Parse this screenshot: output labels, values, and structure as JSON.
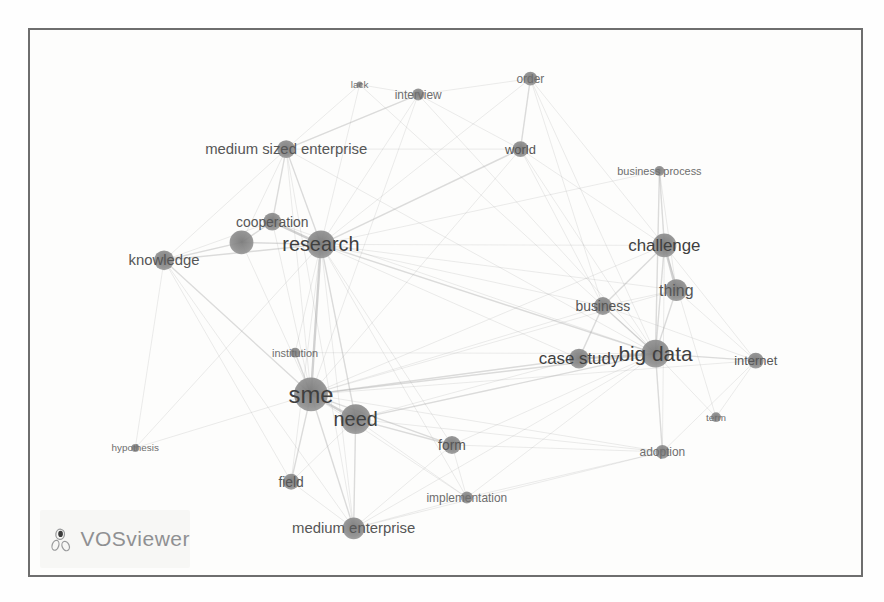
{
  "frame": {
    "border_color": "#6e6e6e",
    "background": "#fdfdfc"
  },
  "logo": {
    "text": "VOSviewer",
    "color": "#8f9092",
    "icon": "vosviewer-network-glyph"
  },
  "chart_data": {
    "type": "network",
    "title": "",
    "tool": "VOSviewer term co-occurrence map",
    "node_color": "#8a8a8a",
    "node_core_color": "#787878",
    "label_color_large": "#3f3f3f",
    "label_color_medium": "#565656",
    "label_color_small": "#6e6e6e",
    "edge_color": "#a8a8a8",
    "canvas": {
      "width": 835,
      "height": 549
    },
    "nodes": [
      {
        "id": "lack",
        "label": "lack",
        "x": 331,
        "y": 55,
        "r": 3,
        "fs": 10
      },
      {
        "id": "interview",
        "label": "interview",
        "x": 390,
        "y": 65,
        "r": 6,
        "fs": 12
      },
      {
        "id": "order",
        "label": "order",
        "x": 503,
        "y": 49,
        "r": 7,
        "fs": 12
      },
      {
        "id": "world",
        "label": "world",
        "x": 493,
        "y": 120,
        "r": 8,
        "fs": 13
      },
      {
        "id": "business-process",
        "label": "business process",
        "x": 633,
        "y": 142,
        "r": 5,
        "fs": 11
      },
      {
        "id": "medium-sized-enterprise",
        "label": "medium sized enterprise",
        "x": 257,
        "y": 120,
        "r": 9,
        "fs": 15
      },
      {
        "id": "cooperation",
        "label": "cooperation",
        "x": 243,
        "y": 193,
        "r": 9,
        "fs": 14
      },
      {
        "id": "unlabeled-cluster-node",
        "label": "",
        "x": 212,
        "y": 214,
        "r": 12,
        "fs": 0
      },
      {
        "id": "research",
        "label": "research",
        "x": 292,
        "y": 216,
        "r": 14,
        "fs": 20
      },
      {
        "id": "knowledge",
        "label": "knowledge",
        "x": 134,
        "y": 232,
        "r": 10,
        "fs": 15
      },
      {
        "id": "challenge",
        "label": "challenge",
        "x": 638,
        "y": 217,
        "r": 12,
        "fs": 17
      },
      {
        "id": "thing",
        "label": "thing",
        "x": 650,
        "y": 262,
        "r": 11,
        "fs": 16
      },
      {
        "id": "business",
        "label": "business",
        "x": 576,
        "y": 278,
        "r": 9,
        "fs": 14
      },
      {
        "id": "case-study",
        "label": "case study",
        "x": 552,
        "y": 331,
        "r": 10,
        "fs": 17
      },
      {
        "id": "big-data",
        "label": "big data",
        "x": 629,
        "y": 326,
        "r": 14,
        "fs": 21
      },
      {
        "id": "internet",
        "label": "internet",
        "x": 730,
        "y": 333,
        "r": 8,
        "fs": 13
      },
      {
        "id": "institution",
        "label": "institution",
        "x": 266,
        "y": 325,
        "r": 5,
        "fs": 11
      },
      {
        "id": "sme",
        "label": "sme",
        "x": 282,
        "y": 367,
        "r": 17,
        "fs": 24
      },
      {
        "id": "need",
        "label": "need",
        "x": 327,
        "y": 392,
        "r": 15,
        "fs": 20
      },
      {
        "id": "term",
        "label": "term",
        "x": 690,
        "y": 390,
        "r": 5,
        "fs": 10
      },
      {
        "id": "adoption",
        "label": "adoption",
        "x": 636,
        "y": 425,
        "r": 7,
        "fs": 12
      },
      {
        "id": "form",
        "label": "form",
        "x": 424,
        "y": 418,
        "r": 9,
        "fs": 14
      },
      {
        "id": "hypothesis",
        "label": "hypothesis",
        "x": 105,
        "y": 421,
        "r": 4,
        "fs": 10
      },
      {
        "id": "field",
        "label": "field",
        "x": 262,
        "y": 455,
        "r": 8,
        "fs": 14
      },
      {
        "id": "implementation",
        "label": "implementation",
        "x": 439,
        "y": 471,
        "r": 6,
        "fs": 12
      },
      {
        "id": "medium-enterprise",
        "label": "medium enterprise",
        "x": 325,
        "y": 502,
        "r": 11,
        "fs": 15
      }
    ],
    "edges": [
      [
        0,
        5,
        1
      ],
      [
        0,
        8,
        1
      ],
      [
        0,
        14,
        1
      ],
      [
        0,
        1,
        1
      ],
      [
        1,
        2,
        1
      ],
      [
        1,
        3,
        1
      ],
      [
        1,
        5,
        2
      ],
      [
        1,
        8,
        1
      ],
      [
        1,
        14,
        1
      ],
      [
        1,
        17,
        1
      ],
      [
        2,
        3,
        2
      ],
      [
        2,
        8,
        1
      ],
      [
        2,
        10,
        1
      ],
      [
        2,
        12,
        1
      ],
      [
        2,
        14,
        1
      ],
      [
        3,
        5,
        1
      ],
      [
        3,
        8,
        2
      ],
      [
        3,
        10,
        1
      ],
      [
        3,
        12,
        1
      ],
      [
        3,
        14,
        1
      ],
      [
        3,
        17,
        1
      ],
      [
        4,
        8,
        1
      ],
      [
        4,
        10,
        2
      ],
      [
        4,
        11,
        1
      ],
      [
        4,
        14,
        2
      ],
      [
        5,
        6,
        2
      ],
      [
        5,
        7,
        1
      ],
      [
        5,
        8,
        2
      ],
      [
        5,
        9,
        1
      ],
      [
        5,
        17,
        1
      ],
      [
        5,
        25,
        1
      ],
      [
        5,
        14,
        1
      ],
      [
        6,
        7,
        2
      ],
      [
        6,
        8,
        3
      ],
      [
        6,
        9,
        1
      ],
      [
        6,
        17,
        1
      ],
      [
        6,
        14,
        1
      ],
      [
        7,
        8,
        2
      ],
      [
        7,
        9,
        2
      ],
      [
        7,
        17,
        1
      ],
      [
        8,
        9,
        2
      ],
      [
        8,
        10,
        1
      ],
      [
        8,
        11,
        1
      ],
      [
        8,
        12,
        1
      ],
      [
        8,
        13,
        1
      ],
      [
        8,
        14,
        2
      ],
      [
        8,
        16,
        1
      ],
      [
        8,
        17,
        3
      ],
      [
        8,
        18,
        2
      ],
      [
        8,
        21,
        1
      ],
      [
        8,
        22,
        1
      ],
      [
        8,
        23,
        1
      ],
      [
        8,
        24,
        1
      ],
      [
        8,
        25,
        1
      ],
      [
        9,
        17,
        2
      ],
      [
        9,
        22,
        1
      ],
      [
        9,
        23,
        1
      ],
      [
        9,
        25,
        1
      ],
      [
        10,
        11,
        3
      ],
      [
        10,
        12,
        2
      ],
      [
        10,
        14,
        2
      ],
      [
        10,
        15,
        1
      ],
      [
        10,
        17,
        1
      ],
      [
        10,
        19,
        1
      ],
      [
        10,
        20,
        1
      ],
      [
        11,
        12,
        1
      ],
      [
        11,
        14,
        2
      ],
      [
        11,
        15,
        1
      ],
      [
        11,
        17,
        1
      ],
      [
        12,
        13,
        2
      ],
      [
        12,
        14,
        2
      ],
      [
        12,
        15,
        1
      ],
      [
        12,
        17,
        1
      ],
      [
        13,
        14,
        3
      ],
      [
        13,
        17,
        2
      ],
      [
        13,
        18,
        1
      ],
      [
        14,
        15,
        2
      ],
      [
        14,
        16,
        1
      ],
      [
        14,
        17,
        2
      ],
      [
        14,
        18,
        2
      ],
      [
        14,
        19,
        1
      ],
      [
        14,
        20,
        2
      ],
      [
        14,
        21,
        1
      ],
      [
        14,
        24,
        1
      ],
      [
        14,
        25,
        1
      ],
      [
        15,
        17,
        1
      ],
      [
        15,
        19,
        1
      ],
      [
        15,
        20,
        1
      ],
      [
        16,
        17,
        2
      ],
      [
        17,
        18,
        3
      ],
      [
        17,
        20,
        1
      ],
      [
        17,
        21,
        2
      ],
      [
        17,
        22,
        1
      ],
      [
        17,
        23,
        2
      ],
      [
        17,
        24,
        1
      ],
      [
        17,
        25,
        2
      ],
      [
        18,
        21,
        2
      ],
      [
        18,
        23,
        1
      ],
      [
        18,
        24,
        1
      ],
      [
        18,
        25,
        2
      ],
      [
        18,
        20,
        1
      ],
      [
        20,
        21,
        1
      ],
      [
        20,
        24,
        1
      ],
      [
        20,
        25,
        1
      ],
      [
        21,
        24,
        1
      ],
      [
        21,
        25,
        1
      ],
      [
        23,
        25,
        1
      ],
      [
        24,
        25,
        1
      ]
    ]
  }
}
